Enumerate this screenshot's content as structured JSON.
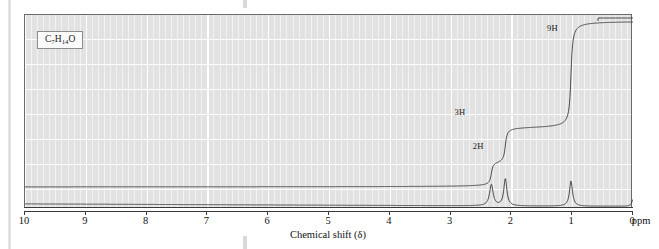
{
  "figure": {
    "formula": "C7H14O",
    "formula_parts": [
      {
        "t": "C"
      },
      {
        "sub": "7"
      },
      {
        "t": "H"
      },
      {
        "sub": "14"
      },
      {
        "t": "O"
      }
    ],
    "xaxis_title": "Chemical shift (δ)",
    "xaxis_unit": "ppm",
    "tick_labels": [
      "10",
      "9",
      "8",
      "7",
      "6",
      "5",
      "4",
      "3",
      "2",
      "1",
      "0"
    ],
    "integral_labels": [
      {
        "text": "2H",
        "ppm": 2.52,
        "level": 0.22
      },
      {
        "text": "3H",
        "ppm": 2.82,
        "level": 0.42
      },
      {
        "text": "9H",
        "ppm": 1.3,
        "level": 0.93
      }
    ],
    "colors": {
      "plot_background": "#e2e2e2",
      "gridline": "#ffffff",
      "trace": "#3a3a3a",
      "frame": "#6a6a6a",
      "text": "#111111",
      "formula_box_fill": "#fbfbfb"
    }
  },
  "chart_data": {
    "type": "line",
    "title": "",
    "subtitle": "",
    "xlabel": "Chemical shift (δ)",
    "ylabel": "",
    "xunit": "ppm",
    "xlim": [
      10,
      0
    ],
    "x_reversed": true,
    "grid": true,
    "legend": "none",
    "annotations": [
      "C7H14O",
      "2H",
      "3H",
      "9H"
    ],
    "series": [
      {
        "name": "1H NMR absorption",
        "type": "line",
        "peaks": [
          {
            "ppm": 2.33,
            "height": 0.11,
            "width": 0.035,
            "protons": 2,
            "assignment": "CH2"
          },
          {
            "ppm": 2.1,
            "height": 0.14,
            "width": 0.03,
            "protons": 3,
            "assignment": "COCH3"
          },
          {
            "ppm": 1.02,
            "height": 0.13,
            "width": 0.03,
            "protons": 9,
            "assignment": "C(CH3)3"
          },
          {
            "ppm": 0.0,
            "height": 0.035,
            "width": 0.022,
            "protons": 0,
            "assignment": "TMS reference"
          }
        ],
        "baseline": 0.0
      },
      {
        "name": "Integral trace",
        "type": "step",
        "steps": [
          {
            "ppm": 2.33,
            "rise": 2,
            "label": "2H"
          },
          {
            "ppm": 2.1,
            "rise": 3,
            "label": "3H"
          },
          {
            "ppm": 1.02,
            "rise": 9,
            "label": "9H"
          }
        ],
        "total_protons": 14,
        "cumulative_levels": [
          0,
          2,
          5,
          14
        ]
      }
    ]
  }
}
